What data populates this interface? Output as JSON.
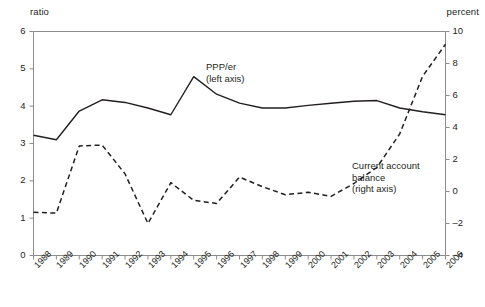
{
  "chart_data": {
    "type": "line",
    "title": "",
    "xlabel": "",
    "categories": [
      "1988",
      "1989",
      "1990",
      "1991",
      "1992",
      "1993",
      "1994",
      "1995",
      "1996",
      "1997",
      "1998",
      "1999",
      "2000",
      "2001",
      "2002",
      "2003",
      "2004",
      "2005",
      "2006"
    ],
    "grid": false,
    "legend_position": "inline-annotations",
    "axes": {
      "left": {
        "label": "ratio",
        "ylim": [
          0,
          6
        ],
        "ticks": [
          0,
          1,
          2,
          3,
          4,
          5,
          6
        ],
        "tick_labels": [
          "0",
          "1",
          "2",
          "3",
          "4",
          "5",
          "6"
        ]
      },
      "right": {
        "label": "percent",
        "ylim": [
          -4,
          10
        ],
        "ticks": [
          -4,
          -2,
          0,
          2,
          4,
          6,
          8,
          10
        ],
        "tick_labels": [
          "–4",
          "–2",
          "0",
          "2",
          "4",
          "6",
          "8",
          "10"
        ]
      }
    },
    "series": [
      {
        "name": "PPP/er",
        "annotation": "PPP/er\n(left axis)",
        "annotation_line1": "PPP/er",
        "annotation_line2": "(left axis)",
        "axis": "left",
        "style": "solid",
        "color": "#231f20",
        "values": [
          3.22,
          3.1,
          3.87,
          4.17,
          4.1,
          3.95,
          3.77,
          4.79,
          4.32,
          4.08,
          3.95,
          3.95,
          4.02,
          4.08,
          4.13,
          4.15,
          3.95,
          3.85,
          3.77
        ]
      },
      {
        "name": "Current account balance",
        "annotation": "Current account\nbalance\n(right axis)",
        "annotation_line1": "Current account",
        "annotation_line2": "balance",
        "annotation_line3": "(right axis)",
        "axis": "right",
        "style": "dashed",
        "color": "#231f20",
        "values": [
          -1.3,
          -1.35,
          2.85,
          2.9,
          1.1,
          -2.0,
          0.55,
          -0.55,
          -0.75,
          0.9,
          0.3,
          -0.2,
          -0.05,
          -0.3,
          0.5,
          1.5,
          3.6,
          7.2,
          9.2
        ]
      }
    ]
  }
}
